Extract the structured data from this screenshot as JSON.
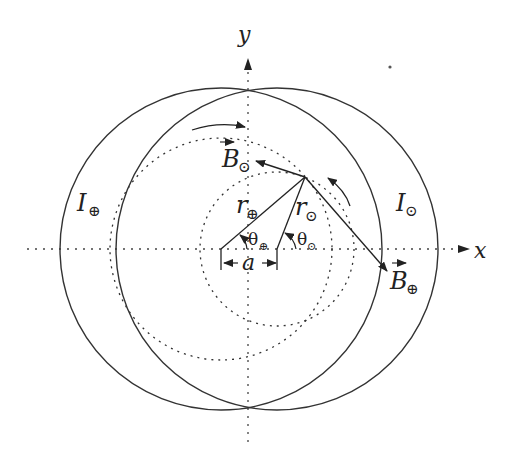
{
  "diagram": {
    "axes": {
      "x_label": "x",
      "y_label": "y"
    },
    "labels": {
      "current_in": "I",
      "current_in_sub": "⊕",
      "current_out": "I",
      "current_out_sub": "⊙",
      "field_out": "B",
      "field_out_sub": "⊙",
      "field_in": "B",
      "field_in_sub": "⊕",
      "radius_in": "r",
      "radius_in_sub": "⊕",
      "radius_out": "r",
      "radius_out_sub": "⊙",
      "angle_in": "θ",
      "angle_in_sub": "⊕",
      "angle_out": "θ",
      "angle_out_sub": "⊙",
      "separation": "a"
    },
    "colors": {
      "stroke": "#333333",
      "background": "#ffffff"
    }
  }
}
